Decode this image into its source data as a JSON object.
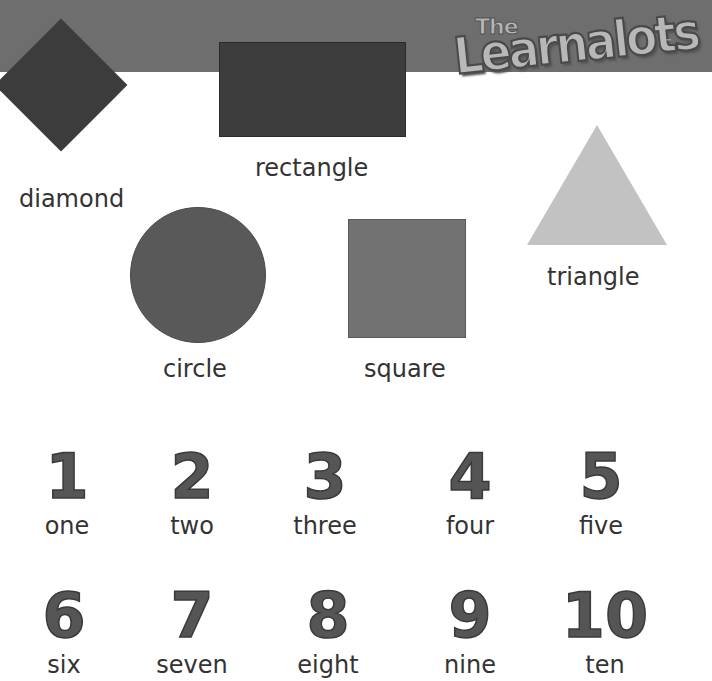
{
  "header": {
    "logo": {
      "prefix": "The",
      "name": "Learnalots",
      "trademark": "™"
    },
    "banner_color": "#6e6e6e"
  },
  "shapes": [
    {
      "id": "diamond",
      "label": "diamond",
      "color": "#3c3c3c"
    },
    {
      "id": "rectangle",
      "label": "rectangle",
      "color": "#3d3d3d"
    },
    {
      "id": "triangle",
      "label": "triangle",
      "color": "#c2c2c2"
    },
    {
      "id": "circle",
      "label": "circle",
      "color": "#595959"
    },
    {
      "id": "square",
      "label": "square",
      "color": "#727272"
    }
  ],
  "numbers": [
    {
      "digit": "1",
      "word": "one"
    },
    {
      "digit": "2",
      "word": "two"
    },
    {
      "digit": "3",
      "word": "three"
    },
    {
      "digit": "4",
      "word": "four"
    },
    {
      "digit": "5",
      "word": "five"
    },
    {
      "digit": "6",
      "word": "six"
    },
    {
      "digit": "7",
      "word": "seven"
    },
    {
      "digit": "8",
      "word": "eight"
    },
    {
      "digit": "9",
      "word": "nine"
    },
    {
      "digit": "10",
      "word": "ten"
    }
  ]
}
